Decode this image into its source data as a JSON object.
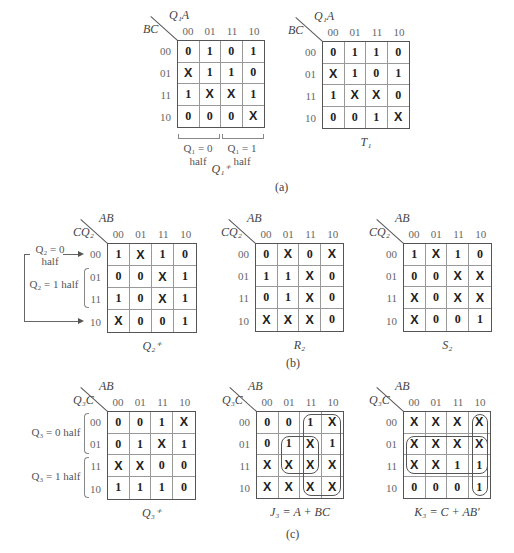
{
  "figure": {
    "part_labels": {
      "a": "(a)",
      "b": "(b)",
      "c": "(c)"
    },
    "col_headers": [
      "00",
      "01",
      "11",
      "10"
    ],
    "row_headers": [
      "00",
      "01",
      "11",
      "10"
    ]
  },
  "maps": {
    "q1_next": {
      "col_var": "Q₁A",
      "row_var": "BC",
      "caption": "Q₁⁺",
      "cells": [
        [
          "0",
          "1",
          "0",
          "1"
        ],
        [
          "X",
          "1",
          "1",
          "0"
        ],
        [
          "1",
          "X",
          "X",
          "1"
        ],
        [
          "0",
          "0",
          "0",
          "X"
        ]
      ],
      "half_left": "Q₁ = 0",
      "half_left_2": "half",
      "half_right": "Q₁ = 1",
      "half_right_2": "half"
    },
    "t1": {
      "col_var": "Q₁A",
      "row_var": "BC",
      "caption": "T₁",
      "cells": [
        [
          "0",
          "1",
          "1",
          "0"
        ],
        [
          "X",
          "1",
          "0",
          "1"
        ],
        [
          "1",
          "X",
          "X",
          "0"
        ],
        [
          "0",
          "0",
          "1",
          "X"
        ]
      ]
    },
    "q2_next": {
      "col_var": "AB",
      "row_var": "CQ₂",
      "caption": "Q₂⁺",
      "cells": [
        [
          "1",
          "X",
          "1",
          "0"
        ],
        [
          "0",
          "0",
          "X",
          "1"
        ],
        [
          "1",
          "0",
          "X",
          "1"
        ],
        [
          "X",
          "0",
          "0",
          "1"
        ]
      ],
      "note_top_1": "Q₂ = 0",
      "note_top_2": "half",
      "note_mid": "Q₂ = 1 half"
    },
    "r2": {
      "col_var": "AB",
      "row_var": "CQ₂",
      "caption": "R₂",
      "cells": [
        [
          "0",
          "X",
          "0",
          "X"
        ],
        [
          "1",
          "1",
          "X",
          "0"
        ],
        [
          "0",
          "1",
          "X",
          "0"
        ],
        [
          "X",
          "X",
          "X",
          "0"
        ]
      ]
    },
    "s2": {
      "col_var": "AB",
      "row_var": "CQ₂",
      "caption": "S₂",
      "cells": [
        [
          "1",
          "X",
          "1",
          "0"
        ],
        [
          "0",
          "0",
          "X",
          "X"
        ],
        [
          "X",
          "0",
          "X",
          "X"
        ],
        [
          "X",
          "0",
          "0",
          "1"
        ]
      ]
    },
    "q3_next": {
      "col_var": "AB",
      "row_var": "Q₃C",
      "caption": "Q₃⁺",
      "cells": [
        [
          "0",
          "0",
          "1",
          "X"
        ],
        [
          "0",
          "1",
          "X",
          "1"
        ],
        [
          "X",
          "X",
          "0",
          "0"
        ],
        [
          "1",
          "1",
          "1",
          "0"
        ]
      ],
      "note_top": "Q₃ = 0 half",
      "note_bottom": "Q₃ = 1 half"
    },
    "j3": {
      "col_var": "AB",
      "row_var": "Q₃C",
      "caption": "J₃ = A + BC",
      "cells": [
        [
          "0",
          "0",
          "1",
          "X"
        ],
        [
          "0",
          "1",
          "X",
          "1"
        ],
        [
          "X",
          "X",
          "X",
          "X"
        ],
        [
          "X",
          "X",
          "X",
          "X"
        ]
      ],
      "groups": [
        "A (columns 11,10)",
        "BC (rows 01,11 x columns 01,11)"
      ]
    },
    "k3": {
      "col_var": "AB",
      "row_var": "Q₃C",
      "caption": "K₃ = C + AB′",
      "cells": [
        [
          "X",
          "X",
          "X",
          "X"
        ],
        [
          "X",
          "X",
          "X",
          "X"
        ],
        [
          "X",
          "X",
          "1",
          "1"
        ],
        [
          "0",
          "0",
          "0",
          "1"
        ]
      ],
      "groups": [
        "C (rows 01,11)",
        "AB' (column 10)"
      ]
    }
  }
}
